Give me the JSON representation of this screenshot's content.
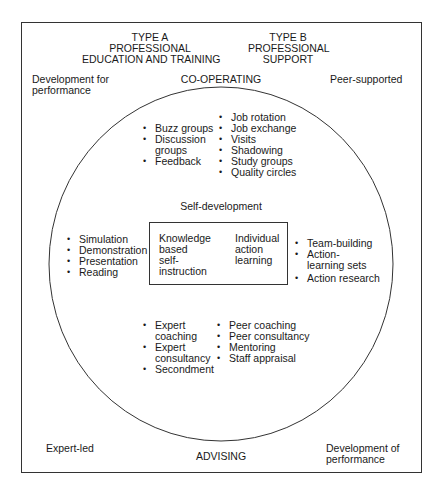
{
  "header": {
    "type_a": {
      "line1": "TYPE A",
      "line2": "PROFESSIONAL",
      "line3": "EDUCATION AND TRAINING"
    },
    "type_b": {
      "line1": "TYPE B",
      "line2": "PROFESSIONAL",
      "line3": "SUPPORT"
    }
  },
  "corners": {
    "top_left": {
      "line1": "Development for",
      "line2": "performance"
    },
    "top_right": "Peer-supported",
    "bottom_left": "Expert-led",
    "bottom_right": {
      "line1": "Development of",
      "line2": "performance"
    }
  },
  "axis_labels": {
    "top": "CO-OPERATING",
    "bottom": "ADVISING",
    "center": "Self-development"
  },
  "quadrants": {
    "top_left_list": [
      "Buzz groups",
      "Discussion groups",
      "Feedback"
    ],
    "top_right_list": [
      "Job rotation",
      "Job exchange",
      "Visits",
      "Shadowing",
      "Study groups",
      "Quality circles"
    ],
    "left_list": [
      "Simulation",
      "Demonstration",
      "Presentation",
      "Reading"
    ],
    "right_list": [
      "Team-building",
      "Action-learning sets",
      "Action research"
    ],
    "bottom_left_list": [
      "Expert coaching",
      "Expert consultancy",
      "Secondment"
    ],
    "bottom_right_list": [
      "Peer coaching",
      "Peer consultancy",
      "Mentoring",
      "Staff appraisal"
    ]
  },
  "inner_box": {
    "left": {
      "line1": "Knowledge",
      "line2": "based",
      "line3": "self-",
      "line4": "instruction"
    },
    "right": {
      "line1": "Individual",
      "line2": "action",
      "line3": "learning"
    }
  },
  "colors": {
    "line": "#333333",
    "text": "#1a1a1a",
    "background": "#ffffff"
  }
}
